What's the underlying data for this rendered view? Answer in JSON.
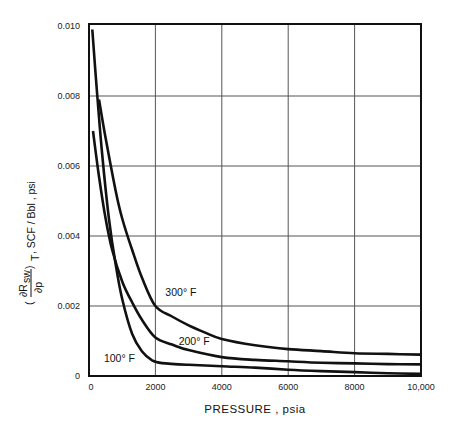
{
  "chart_data": {
    "type": "line",
    "title": "",
    "xlabel": "PRESSURE , psia",
    "ylabel": "(∂Rsw/∂p)T , SCF / Bbl , psi",
    "ylabel_parts": {
      "numerator": "∂R",
      "numerator_sub": "sw",
      "denominator": "∂p",
      "outer_sub": "T",
      "units": ", SCF / Bbl , psi"
    },
    "xlim": [
      0,
      10000
    ],
    "ylim": [
      0,
      0.01
    ],
    "x_ticks": [
      0,
      2000,
      4000,
      6000,
      8000,
      10000
    ],
    "x_tick_labels": [
      "0",
      "2000",
      "4000",
      "6000",
      "8000",
      "10,000"
    ],
    "y_ticks": [
      0,
      0.002,
      0.004,
      0.006,
      0.008,
      0.01
    ],
    "y_tick_labels": [
      "0",
      "0.002",
      "0.004",
      "0.006",
      "0.008",
      "0.010"
    ],
    "grid": true,
    "legend": "inline labels on curves",
    "series": [
      {
        "name": "100° F",
        "label": "100° F",
        "x": [
          100,
          250,
          400,
          600,
          800,
          1000,
          1300,
          1600,
          1900,
          2200,
          3000,
          4000,
          5000,
          6000,
          7000,
          8000,
          9000,
          10000
        ],
        "values": [
          0.0099,
          0.008,
          0.0063,
          0.0045,
          0.0032,
          0.0022,
          0.0012,
          0.0007,
          0.00045,
          0.00037,
          0.00032,
          0.00028,
          0.00024,
          0.00018,
          0.00014,
          0.00011,
          8e-05,
          6e-05
        ]
      },
      {
        "name": "200° F",
        "label": "200° F",
        "x": [
          120,
          300,
          500,
          700,
          1000,
          1300,
          1600,
          2000,
          2500,
          3000,
          4000,
          5000,
          6000,
          7000,
          8000,
          9000,
          10000
        ],
        "values": [
          0.007,
          0.0057,
          0.0045,
          0.0036,
          0.0027,
          0.0021,
          0.0016,
          0.0011,
          0.0009,
          0.00074,
          0.00054,
          0.00046,
          0.00042,
          0.00038,
          0.00036,
          0.00034,
          0.00033
        ]
      },
      {
        "name": "300° F",
        "label": "300° F",
        "x": [
          300,
          500,
          800,
          1000,
          1300,
          1600,
          2000,
          2500,
          3000,
          3500,
          4000,
          5000,
          6000,
          7000,
          8000,
          9000,
          10000
        ],
        "values": [
          0.0079,
          0.0068,
          0.0053,
          0.0045,
          0.0036,
          0.0028,
          0.002,
          0.0017,
          0.00145,
          0.00124,
          0.00106,
          0.00088,
          0.00077,
          0.00071,
          0.00065,
          0.00063,
          0.00061
        ]
      }
    ],
    "annotations": [
      {
        "text": "300° F",
        "x": 2300,
        "y": 0.0023
      },
      {
        "text": "200° F",
        "x": 2700,
        "y": 0.0009
      },
      {
        "text": "100° F",
        "x": 450,
        "y": 0.0004
      }
    ]
  },
  "axes": {
    "x_title": "PRESSURE , psia",
    "y_title_units": ", SCF / Bbl , psi",
    "y_title_num": "∂R",
    "y_title_num_sub": "sw",
    "y_title_den": "∂p",
    "y_title_outer_sub": "T"
  },
  "colors": {
    "line": "#111111",
    "grid": "#555555",
    "background": "#ffffff"
  }
}
